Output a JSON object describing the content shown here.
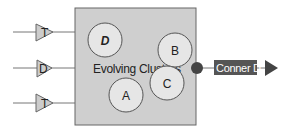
{
  "diagram": {
    "cluster_box": {
      "title": "Evolving Clusters",
      "fill": "#cfcfcf",
      "stroke": "#666666"
    },
    "inputs": [
      {
        "label": "T",
        "y": 32
      },
      {
        "label": "D",
        "y": 68
      },
      {
        "label": "T",
        "y": 103
      }
    ],
    "clusters": [
      {
        "label": "D",
        "cx": 105,
        "cy": 40,
        "italic": true
      },
      {
        "label": "A",
        "cx": 126,
        "cy": 95,
        "italic": false
      },
      {
        "label": "B",
        "cx": 175,
        "cy": 50,
        "italic": false
      },
      {
        "label": "C",
        "cx": 167,
        "cy": 83,
        "italic": false
      }
    ],
    "output": {
      "label": "Conner D",
      "fill": "#555555",
      "text_color": "#ffffff"
    },
    "colors": {
      "circle_fill": "#e6e6e6",
      "circle_stroke": "#555555",
      "line": "#777777",
      "triangle_fill": "#cccccc",
      "dot": "#444444"
    }
  }
}
